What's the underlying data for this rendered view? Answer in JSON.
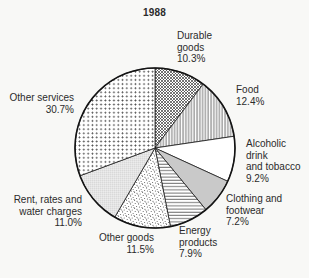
{
  "chart_data": {
    "type": "pie",
    "title": "1988",
    "unit": "%",
    "direction": "clockwise",
    "start_angle_deg": 0,
    "slices": [
      {
        "label": "Durable goods",
        "value": 10.3,
        "percent_label": "10.3%",
        "label_text": "Durable\ngoods\n10.3%",
        "pattern": "diagonal-crosshatch"
      },
      {
        "label": "Food",
        "value": 12.4,
        "percent_label": "12.4%",
        "label_text": "Food\n12.4%",
        "pattern": "vertical-lines"
      },
      {
        "label": "Alcoholic drink and tobacco",
        "value": 9.2,
        "percent_label": "9.2%",
        "label_text": "Alcoholic\ndrink\nand tobacco\n9.2%",
        "pattern": "plain-white"
      },
      {
        "label": "Clothing and footwear",
        "value": 7.2,
        "percent_label": "7.2%",
        "label_text": "Clothing and\nfootwear\n7.2%",
        "pattern": "solid-gray"
      },
      {
        "label": "Energy products",
        "value": 7.9,
        "percent_label": "7.9%",
        "label_text": "Energy\nproducts\n7.9%",
        "pattern": "horizontal-lines"
      },
      {
        "label": "Other goods",
        "value": 11.5,
        "percent_label": "11.5%",
        "label_text": "Other goods\n11.5%",
        "pattern": "stipple-dots"
      },
      {
        "label": "Rent, rates and water charges",
        "value": 11.0,
        "percent_label": "11.0%",
        "label_text": "Rent, rates and\nwater charges\n11.0%",
        "pattern": "fine-dot-grid"
      },
      {
        "label": "Other services",
        "value": 30.7,
        "percent_label": "30.7%",
        "label_text": "Other services\n30.7%",
        "pattern": "plus-grid"
      }
    ],
    "colors": {
      "ink": "#1c1c1c",
      "hatch": "#3a3a3a",
      "gray_fill": "#c9c9c9",
      "background": "#f8f8f6"
    }
  }
}
